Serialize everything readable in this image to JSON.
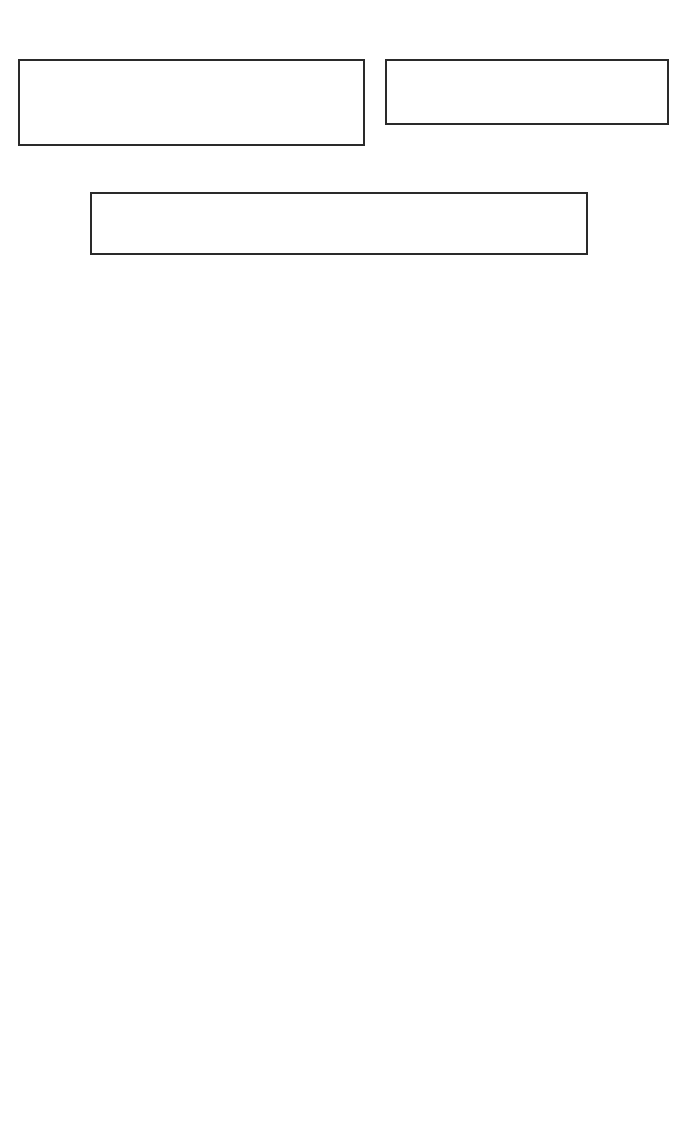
{
  "diagram": {
    "type": "flowchart",
    "colors": {
      "line": "#2a2a2a",
      "background": "#ffffff"
    },
    "nodes": {
      "lotran_box": {
        "prefix": "Data sets (",
        "vars": "θ, θ",
        "sub0": "0",
        "vars2": ", Δφ, AM, ρ",
        "subs": "s",
        "vars3": ", L",
        "subp": "p",
        "n865": "(865), L",
        "subtc": "tc",
        "close": ")",
        "line2": "by LOTRAN model"
      },
      "oci_box": {
        "prefix": "OCI observed data (",
        "vars": "θ, θ",
        "sub0": "0",
        "vars2": ", Δφ,  L",
        "subt": "t",
        "close": ")"
      },
      "obtain_box": {
        "prefix": "Obtain a set of corresponding data (",
        "vars": "θ, θ",
        "sub0": "0",
        "vars2": ", AM, ρ",
        "subs": "s",
        "vars3": ", L",
        "subp": "p",
        "n865": "(865), L",
        "subtc": "tc",
        "vars4": ", L",
        "subt": "t",
        "close": ")"
      },
      "ratio_box": {
        "crat_label": "crat68 =",
        "crat_num": "ρ",
        "crat_num_sub": "c",
        "crat_num_arg": "(670)",
        "crat_den": "ρ",
        "crat_den_sub": "c",
        "crat_den_arg": "(865)",
        "rat_label": "rat68 =",
        "rat_num": "ρ(670)",
        "rat_den": "ρ(865)",
        "line2_L": "L",
        "line2_sub": "a",
        "line2_rest": "(i), i = 1,2,..,6"
      },
      "decision1": {
        "L1": "L",
        "s1": "p",
        "a1": "(865) – L",
        "s2": "r",
        "a2": "(865) – L",
        "s3": "a",
        "a3": "(865)",
        "line2": "≤ 0.001"
      },
      "decision2": {
        "L1": "L",
        "s1": "t",
        "a1": "(i) – L",
        "s2": "r",
        "a2": "(i) – L",
        "s3": "a",
        "a3": "(i) > 0",
        "line2": "i = 1,2,3,4"
      },
      "diff_box": {
        "d1": "d",
        "d1_sub": "670",
        "eq1": " = L",
        "s1": "t",
        "a1": "(670) – L",
        "s2": "r",
        "a2": "(670) – L",
        "s3": "a",
        "a3": "(670)",
        "d2": "d",
        "d2_sub": "rat68",
        "eq2": " = crat68 – rat68"
      },
      "next_circle": {
        "label": "Next"
      },
      "determine_box": {
        "line1_a": "Determinate the ",
        "line1_am": "AM",
        "line1_b": " and ",
        "line1_rho": "ρ",
        "line1_sub": "s",
        "line2_a": "by minimum ",
        "line2_d1": "d",
        "line2_d1_sub": "670",
        "line2_b": " or minimum ",
        "line2_d2": "d",
        "line2_d2_sub": "rat68"
      },
      "output_box": {
        "L": "L",
        "sub": "a",
        "rest": "(i),τ(i),    i = 1,2,...,6"
      }
    },
    "edge_labels": {
      "no1": "No",
      "no2": "No",
      "yes1": "Yes",
      "yes2": "Yes"
    }
  }
}
